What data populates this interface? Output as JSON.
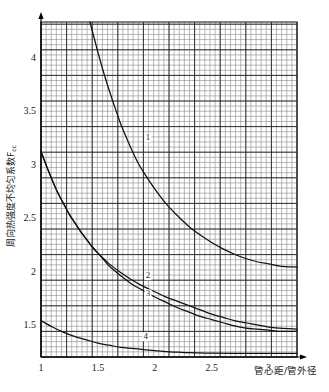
{
  "chart_data": {
    "type": "line",
    "title": "",
    "xlabel": "管心距/管外径",
    "ylabel": "周向热强度不均匀系数F",
    "ylabel_sub": "cc",
    "xlim": [
      1,
      3.25
    ],
    "ylim": [
      1.2,
      4.33
    ],
    "xticks": [
      1,
      1.5,
      2,
      2.5,
      3
    ],
    "xtick_labels": [
      "1",
      "1.5",
      "2",
      "2.5",
      "3"
    ],
    "yticks": [
      1.5,
      2,
      2.5,
      3,
      3.5,
      4
    ],
    "ytick_labels": [
      "1.5",
      "2",
      "2.5",
      "3",
      "3.5",
      "4"
    ],
    "grid": "on",
    "grid_minor_step_x": 0.045,
    "grid_minor_step_y": 0.0465,
    "legend": "none",
    "series": [
      {
        "name": "1",
        "label": "1",
        "label_x": 1.94,
        "label_y": 3.24,
        "points": [
          [
            1.43,
            4.33
          ],
          [
            1.5,
            4.05
          ],
          [
            1.55,
            3.86
          ],
          [
            1.6,
            3.69
          ],
          [
            1.65,
            3.53
          ],
          [
            1.7,
            3.38
          ],
          [
            1.75,
            3.25
          ],
          [
            1.8,
            3.13
          ],
          [
            1.85,
            3.02
          ],
          [
            1.9,
            2.93
          ],
          [
            2.0,
            2.77
          ],
          [
            2.1,
            2.63
          ],
          [
            2.2,
            2.52
          ],
          [
            2.3,
            2.42
          ],
          [
            2.4,
            2.34
          ],
          [
            2.5,
            2.27
          ],
          [
            2.6,
            2.21
          ],
          [
            2.7,
            2.16
          ],
          [
            2.8,
            2.12
          ],
          [
            2.9,
            2.09
          ],
          [
            3.0,
            2.07
          ],
          [
            3.1,
            2.05
          ],
          [
            3.25,
            2.04
          ]
        ]
      },
      {
        "name": "2",
        "label": "2",
        "label_x": 1.94,
        "label_y": 1.95,
        "points": [
          [
            1.0,
            3.12
          ],
          [
            1.05,
            2.98
          ],
          [
            1.1,
            2.85
          ],
          [
            1.15,
            2.73
          ],
          [
            1.2,
            2.63
          ],
          [
            1.25,
            2.53
          ],
          [
            1.3,
            2.45
          ],
          [
            1.35,
            2.37
          ],
          [
            1.4,
            2.3
          ],
          [
            1.45,
            2.23
          ],
          [
            1.5,
            2.17
          ],
          [
            1.55,
            2.12
          ],
          [
            1.6,
            2.07
          ],
          [
            1.7,
            1.99
          ],
          [
            1.8,
            1.92
          ],
          [
            1.9,
            1.86
          ],
          [
            2.0,
            1.81
          ],
          [
            2.1,
            1.76
          ],
          [
            2.2,
            1.72
          ],
          [
            2.3,
            1.68
          ],
          [
            2.4,
            1.64
          ],
          [
            2.5,
            1.6
          ],
          [
            2.6,
            1.57
          ],
          [
            2.7,
            1.54
          ],
          [
            2.8,
            1.52
          ],
          [
            2.9,
            1.5
          ],
          [
            3.0,
            1.48
          ],
          [
            3.1,
            1.47
          ],
          [
            3.25,
            1.46
          ]
        ]
      },
      {
        "name": "3",
        "label": "3",
        "label_x": 1.94,
        "label_y": 1.78,
        "points": [
          [
            1.0,
            3.12
          ],
          [
            1.05,
            2.98
          ],
          [
            1.1,
            2.85
          ],
          [
            1.15,
            2.73
          ],
          [
            1.2,
            2.63
          ],
          [
            1.25,
            2.53
          ],
          [
            1.3,
            2.45
          ],
          [
            1.35,
            2.37
          ],
          [
            1.4,
            2.3
          ],
          [
            1.45,
            2.23
          ],
          [
            1.5,
            2.17
          ],
          [
            1.55,
            2.11
          ],
          [
            1.6,
            2.05
          ],
          [
            1.7,
            1.96
          ],
          [
            1.8,
            1.88
          ],
          [
            1.9,
            1.82
          ],
          [
            2.0,
            1.76
          ],
          [
            2.1,
            1.71
          ],
          [
            2.2,
            1.66
          ],
          [
            2.3,
            1.62
          ],
          [
            2.4,
            1.58
          ],
          [
            2.5,
            1.55
          ],
          [
            2.6,
            1.52
          ],
          [
            2.7,
            1.49
          ],
          [
            2.8,
            1.47
          ],
          [
            2.9,
            1.46
          ],
          [
            3.0,
            1.45
          ],
          [
            3.1,
            1.44
          ],
          [
            3.25,
            1.44
          ]
        ]
      },
      {
        "name": "4",
        "label": "4",
        "label_x": 1.92,
        "label_y": 1.38,
        "points": [
          [
            1.0,
            1.54
          ],
          [
            1.1,
            1.48
          ],
          [
            1.2,
            1.43
          ],
          [
            1.3,
            1.39
          ],
          [
            1.4,
            1.36
          ],
          [
            1.5,
            1.33
          ],
          [
            1.6,
            1.31
          ],
          [
            1.7,
            1.29
          ],
          [
            1.8,
            1.28
          ],
          [
            1.9,
            1.27
          ],
          [
            2.0,
            1.26
          ],
          [
            2.1,
            1.25
          ],
          [
            2.2,
            1.245
          ],
          [
            2.3,
            1.24
          ],
          [
            2.4,
            1.238
          ],
          [
            2.5,
            1.236
          ],
          [
            2.7,
            1.234
          ],
          [
            3.0,
            1.233
          ],
          [
            3.25,
            1.233
          ]
        ]
      }
    ]
  },
  "colors": {
    "curve": "#111111",
    "grid_minor": "#8a8a8a",
    "grid_major": "#222222",
    "axis": "#000000",
    "text": "#1a1a1a"
  }
}
